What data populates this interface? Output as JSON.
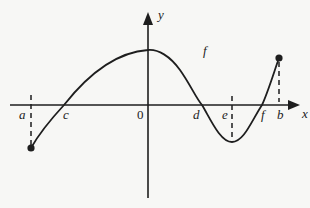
{
  "diagram": {
    "type": "function-graph",
    "function_label": "f",
    "axes": {
      "x_label": "x",
      "y_label": "y",
      "origin_label": "0"
    },
    "x_points": [
      {
        "label": "a",
        "note": "left endpoint, closed dot below axis"
      },
      {
        "label": "c",
        "note": "zero of f"
      },
      {
        "label": "d",
        "note": "zero of f"
      },
      {
        "label": "e",
        "note": "local minimum location"
      },
      {
        "label": "f",
        "note": "zero of f"
      },
      {
        "label": "b",
        "note": "right endpoint, closed dot above axis"
      }
    ],
    "colors": {
      "ink": "#1e1e1e",
      "background": "#f7f7f5"
    }
  }
}
